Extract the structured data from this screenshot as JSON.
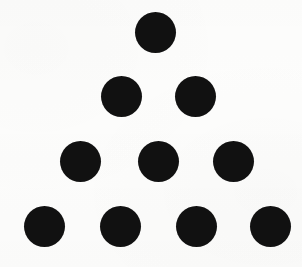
{
  "figure": {
    "kind": "dot-pattern",
    "name": "triangular-dot-array",
    "canvas": {
      "width": 302,
      "height": 267,
      "background_color": "#fdfdfc"
    },
    "dot_color": "#111111",
    "dot_diameter": 41,
    "total_dots": 10,
    "row_count": 4,
    "rows": [
      {
        "index": 1,
        "label": "row-1",
        "count": 1,
        "center_y": 32,
        "dots": [
          {
            "label": "dot-1-1",
            "cx": 155,
            "cy": 32,
            "d": 41
          }
        ]
      },
      {
        "index": 2,
        "label": "row-2",
        "count": 2,
        "center_y": 96,
        "dots": [
          {
            "label": "dot-2-1",
            "cx": 121,
            "cy": 96,
            "d": 41
          },
          {
            "label": "dot-2-2",
            "cx": 195,
            "cy": 96,
            "d": 41
          }
        ]
      },
      {
        "index": 3,
        "label": "row-3",
        "count": 3,
        "center_y": 161,
        "dots": [
          {
            "label": "dot-3-1",
            "cx": 80,
            "cy": 161,
            "d": 41
          },
          {
            "label": "dot-3-2",
            "cx": 158,
            "cy": 161,
            "d": 41
          },
          {
            "label": "dot-3-3",
            "cx": 233,
            "cy": 161,
            "d": 41
          }
        ]
      },
      {
        "index": 4,
        "label": "row-4",
        "count": 4,
        "center_y": 226,
        "dots": [
          {
            "label": "dot-4-1",
            "cx": 44,
            "cy": 226,
            "d": 41
          },
          {
            "label": "dot-4-2",
            "cx": 120,
            "cy": 226,
            "d": 41
          },
          {
            "label": "dot-4-3",
            "cx": 196,
            "cy": 226,
            "d": 41
          },
          {
            "label": "dot-4-4",
            "cx": 270,
            "cy": 226,
            "d": 41
          }
        ]
      }
    ]
  }
}
